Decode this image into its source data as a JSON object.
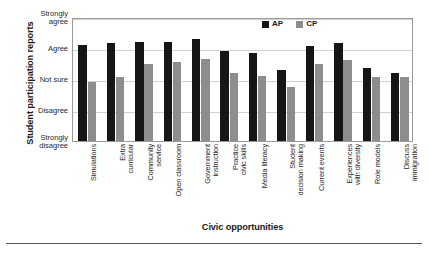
{
  "chart_data": {
    "type": "bar",
    "title": "",
    "xlabel": "Civic opportunities",
    "ylabel": "Student participation reports",
    "categories": [
      "Simulations",
      "Extra curricular",
      "Community service",
      "Open classroom",
      "Government instruction",
      "Practice civic skills",
      "Media literacy",
      "Student decision making",
      "Current events",
      "Experiences with diversity",
      "Role models",
      "Discuss immigration"
    ],
    "series": [
      {
        "name": "AP",
        "color": "#161616",
        "values": [
          4.1,
          4.15,
          4.2,
          4.2,
          4.3,
          3.9,
          3.85,
          3.3,
          4.05,
          4.15,
          3.35,
          3.2
        ]
      },
      {
        "name": "CP",
        "color": "#8d8d8d",
        "values": [
          2.9,
          3.05,
          3.5,
          3.55,
          3.65,
          3.2,
          3.1,
          2.75,
          3.5,
          3.6,
          3.05,
          3.05
        ]
      }
    ],
    "ylim": [
      1,
      5
    ],
    "ytick_values": [
      5,
      4,
      3,
      2,
      1
    ],
    "ytick_labels": [
      {
        "l1": "Strongly",
        "l2": "agree"
      },
      {
        "l1": "Agree",
        "l2": ""
      },
      {
        "l1": "Not sure",
        "l2": ""
      },
      {
        "l1": "Disagree",
        "l2": ""
      },
      {
        "l1": "Strongly",
        "l2": "disagree"
      }
    ],
    "xtick_labels": [
      {
        "l1": "Simulations",
        "l2": ""
      },
      {
        "l1": "Extra",
        "l2": "curricular"
      },
      {
        "l1": "Community",
        "l2": "service"
      },
      {
        "l1": "Open classroom",
        "l2": ""
      },
      {
        "l1": "Government",
        "l2": "instruction"
      },
      {
        "l1": "Practice",
        "l2": "civic skills"
      },
      {
        "l1": "Media literacy",
        "l2": ""
      },
      {
        "l1": "Student",
        "l2": "decision making"
      },
      {
        "l1": "Current events",
        "l2": ""
      },
      {
        "l1": "Experiences",
        "l2": "with diversity"
      },
      {
        "l1": "Role models",
        "l2": ""
      },
      {
        "l1": "Discuss",
        "l2": "immigration"
      }
    ],
    "grid": true,
    "legend_position": "top-right",
    "legend": [
      {
        "label": "AP",
        "color": "#161616"
      },
      {
        "label": "CP",
        "color": "#8d8d8d"
      }
    ]
  }
}
